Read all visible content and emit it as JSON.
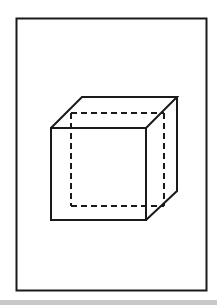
{
  "figure": {
    "stroke_color": "#1a1a1a",
    "background_color": "#ffffff",
    "band_color": "#c8c8c8"
  },
  "frame": {
    "x": 16,
    "y": 18,
    "width": 190,
    "height": 272
  },
  "cube": {
    "front_face": {
      "x1": 51,
      "y1": 128,
      "x2": 146,
      "y2": 220
    },
    "back_top_left": [
      82,
      97
    ],
    "back_top_right": [
      177,
      97
    ],
    "back_bottom_right": [
      177,
      191
    ],
    "hidden_back_face": {
      "x1": 71,
      "y1": 113,
      "x2": 164,
      "y2": 206
    }
  }
}
